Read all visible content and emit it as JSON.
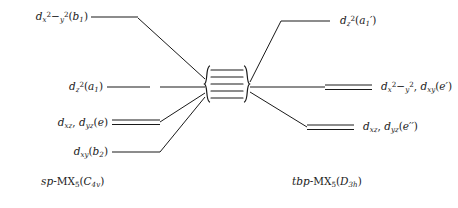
{
  "figure": {
    "type": "orbital-splitting-diagram",
    "stroke_color": "#1a1a1a",
    "background_color": "#ffffff",
    "left": {
      "caption": "sp-MX₅(C₄ᴠ)",
      "caption_parts": {
        "prefix": "sp",
        "separator": "-",
        "formula": "MX",
        "formula_sub": "5",
        "group_open": "(",
        "point_group": "C",
        "point_group_sub": "4v",
        "group_close": ")"
      },
      "levels": [
        {
          "id": "left-level-1",
          "label": "dₓ²₋ᵧ²(b₁)",
          "orbital": "d",
          "orbital_sub": "x",
          "orbital_sup": "2",
          "orbital_sub2": "−y",
          "orbital_sup2": "2",
          "term": "(b",
          "term_sub": "1",
          "term_close": ")",
          "degeneracy": 1,
          "y": 17
        },
        {
          "id": "left-level-2",
          "label": "dᵩ²(a₁)",
          "orbital": "d",
          "orbital_sub": "z",
          "orbital_sup": "2",
          "term": "(a",
          "term_sub": "1",
          "term_close": ")",
          "degeneracy": 1,
          "y": 87
        },
        {
          "id": "left-level-3",
          "label": "dₓᵩ, dᵧᵩ(e)",
          "orbital": "d",
          "orbital_sub": "xz",
          "orbital2": "d",
          "orbital2_sub": "yz",
          "term": "(e",
          "term_close": ")",
          "degeneracy": 2,
          "y": 123
        },
        {
          "id": "left-level-4",
          "label": "dₓᵧ(b₂)",
          "orbital": "d",
          "orbital_sub": "xy",
          "term": "(b",
          "term_sub": "2",
          "term_close": ")",
          "degeneracy": 1,
          "y": 152
        }
      ]
    },
    "right": {
      "caption": "tbp-MX₅(D₃h)",
      "caption_parts": {
        "prefix": "tbp",
        "separator": "-",
        "formula": "MX",
        "formula_sub": "5",
        "group_open": "(",
        "point_group": "D",
        "point_group_sub": "3h",
        "group_close": ")"
      },
      "levels": [
        {
          "id": "right-level-1",
          "label": "dᵩ²(a₁′)",
          "orbital": "d",
          "orbital_sub": "z",
          "orbital_sup": "2",
          "term": "(a",
          "term_sub": "1",
          "term_prime": "′",
          "term_close": ")",
          "degeneracy": 1,
          "y": 21
        },
        {
          "id": "right-level-2",
          "label": "dₓ²₋ᵧ², dₓᵧ(e′)",
          "orbital": "d",
          "orbital_sub": "x",
          "orbital_sup": "2",
          "orbital_sub2": "−y",
          "orbital_sup2": "2",
          "orbital2": "d",
          "orbital2_sub": "xy",
          "term": "(e",
          "term_prime": "′",
          "term_close": ")",
          "degeneracy": 2,
          "y": 87
        },
        {
          "id": "right-level-3",
          "label": "dₓᵩ, dᵧᵩ(e′′)",
          "orbital": "d",
          "orbital_sub": "xz",
          "orbital2": "d",
          "orbital2_sub": "yz",
          "term": "(e",
          "term_prime": "′′",
          "term_close": ")",
          "degeneracy": 2,
          "y": 127
        }
      ]
    },
    "center": {
      "name": "manifold-brace",
      "line_count": 5,
      "top": 66,
      "bottom": 102,
      "left_x": 206,
      "right_x": 248
    }
  }
}
